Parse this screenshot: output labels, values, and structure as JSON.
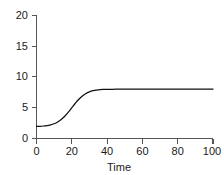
{
  "chart_data": {
    "type": "line",
    "title": "",
    "subtitle": "",
    "xlabel": "Time",
    "ylabel": "",
    "xlim": [
      0,
      100
    ],
    "ylim": [
      0,
      20
    ],
    "grid": false,
    "legend": null,
    "legend_position": "none",
    "line_color": "#111111",
    "axis_color": "#555555",
    "text_color": "#1a1a1a",
    "background": "#ffffff",
    "xticks": [
      0,
      20,
      40,
      60,
      80,
      100
    ],
    "xtick_labels": [
      "0",
      "20",
      "40",
      "60",
      "80",
      "100"
    ],
    "yticks": [
      0,
      5,
      10,
      15,
      20
    ],
    "ytick_labels": [
      "0",
      "5",
      "10",
      "15",
      "20"
    ],
    "series": [
      {
        "name": "population",
        "x": [
          0,
          2,
          4,
          6,
          8,
          10,
          12,
          14,
          16,
          18,
          20,
          22,
          24,
          26,
          28,
          30,
          32,
          34,
          36,
          38,
          40,
          45,
          50,
          55,
          60,
          65,
          70,
          75,
          80,
          85,
          90,
          95,
          100
        ],
        "y": [
          1.95,
          1.98,
          2.03,
          2.1,
          2.22,
          2.4,
          2.68,
          3.08,
          3.62,
          4.28,
          5.0,
          5.72,
          6.37,
          6.9,
          7.3,
          7.58,
          7.76,
          7.87,
          7.93,
          7.96,
          7.98,
          8.0,
          8.0,
          8.0,
          8.0,
          8.0,
          8.0,
          8.0,
          8.0,
          8.0,
          8.0,
          8.0,
          8.0
        ]
      }
    ],
    "baseline_value": 2,
    "plateau_value": 8,
    "inflection_time": 20
  }
}
